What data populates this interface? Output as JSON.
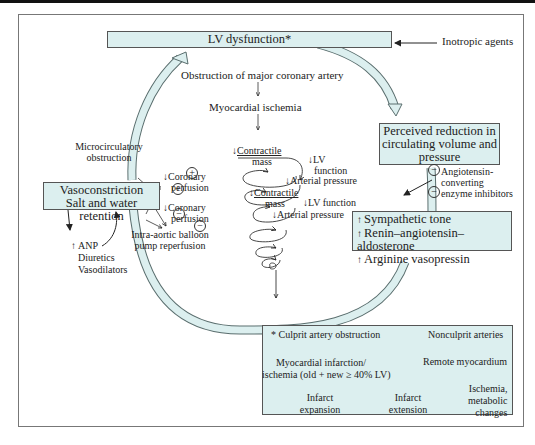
{
  "diagram": {
    "top_box": {
      "label": "LV dysfunction*"
    },
    "inotropic": {
      "label": "Inotropic agents"
    },
    "center": {
      "obstruction": "Obstruction of major coronary artery",
      "ischemia": "Myocardial ischemia",
      "micro_obstruction": [
        "Microcirculatory",
        "obstruction"
      ],
      "coronary_perfusion_1": [
        "Coronary",
        "perfusion"
      ],
      "coronary_perfusion_2": [
        "Coronary",
        "perfusion"
      ],
      "iabp": [
        "Intra-aortic balloon",
        "pump reperfusion"
      ],
      "contractile_mass_1": [
        "Contractile",
        "mass"
      ],
      "lv_function_1": [
        "LV",
        "function"
      ],
      "arterial_pressure_1": "Arterial pressure",
      "contractile_mass_2": [
        "Contractile",
        "mass"
      ],
      "lv_function_2": "LV function",
      "arterial_pressure_2": "Arterial pressure",
      "signs": [
        "+",
        "+",
        "−",
        "−"
      ]
    },
    "left_box": {
      "lines": [
        "Vasoconstriction",
        "Salt and water retention"
      ]
    },
    "left_modifiers": {
      "lines": [
        "ANP",
        "Diuretics",
        "Vasodilators"
      ]
    },
    "right_box_1": {
      "lines": [
        "Perceived reduction in",
        "circulating volume and",
        "pressure"
      ]
    },
    "ace": {
      "lines": [
        "Angiotensin-",
        "converting",
        "enzyme inhibitors"
      ],
      "signs": [
        "−",
        "−"
      ]
    },
    "right_box_2": {
      "lines": [
        "Sympathetic tone",
        "Renin–angiotensin–aldosterone",
        "Arginine vasopressin"
      ]
    },
    "footnote_box": {
      "culprit": "Culprit artery obstruction",
      "asterisk": "*",
      "nonculprit": "Nonculprit arteries",
      "mi": [
        "Myocardial infarction/",
        "ischemia (old + new ≥ 40% LV)"
      ],
      "remote": "Remote myocardium",
      "expansion": [
        "Infarct",
        "expansion"
      ],
      "extension": [
        "Infarct",
        "extension"
      ],
      "ischemia_meta": [
        "Ischemia,",
        "metabolic",
        "changes"
      ]
    },
    "colors": {
      "box_fill": "#dcefef",
      "box_border": "#555555",
      "line": "#333333",
      "frame": "#777777"
    }
  }
}
